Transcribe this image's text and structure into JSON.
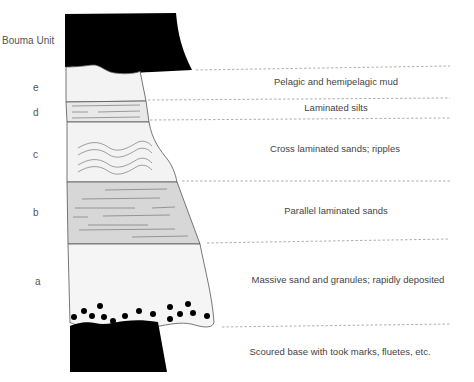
{
  "title": "Bouma Unit",
  "colors": {
    "mud_black": "#000000",
    "light_fill": "#f4f4f4",
    "silt_fill": "#e6e6e6",
    "parallel_fill": "#d6d6d6",
    "outline": "#555555",
    "dash": "#999999",
    "text": "#444444"
  },
  "units": [
    {
      "letter": "e",
      "description": "Pelagic and hemipelagic mud"
    },
    {
      "letter": "d",
      "description": "Laminated silts"
    },
    {
      "letter": "c",
      "description": "Cross laminated sands; ripples"
    },
    {
      "letter": "b",
      "description": "Parallel laminated sands"
    },
    {
      "letter": "a",
      "description": "Massive sand and granules; rapidly deposited"
    }
  ],
  "base_description": "Scoured base with took marks, fluetes, etc."
}
